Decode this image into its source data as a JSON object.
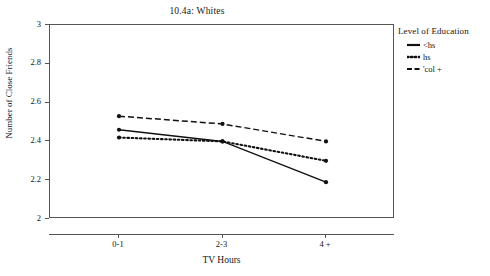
{
  "chart_data": {
    "type": "line",
    "title": "10.4a: Whites",
    "xlabel": "TV Hours",
    "ylabel": "Number of Close Friends",
    "categories": [
      "0-1",
      "2-3",
      "4 +"
    ],
    "ylim": [
      2,
      3
    ],
    "yticks": [
      "2",
      "2.2",
      "2.4",
      "2.6",
      "2.8",
      "3"
    ],
    "grid": false,
    "legend_position": "right",
    "legend_title": "Level of Education",
    "series": [
      {
        "name": "<hs",
        "style": "solid",
        "marker": "filled-circle",
        "values": [
          2.46,
          2.4,
          2.19
        ]
      },
      {
        "name": "hs",
        "style": "dotted",
        "marker": "filled-circle",
        "values": [
          2.42,
          2.4,
          2.3
        ]
      },
      {
        "name": "'col +",
        "style": "dash-dot",
        "marker": "filled-circle",
        "values": [
          2.53,
          2.49,
          2.4
        ]
      }
    ]
  },
  "legend": {
    "title": "Level of Education",
    "items": [
      {
        "label": "<hs"
      },
      {
        "label": "hs"
      },
      {
        "label": "'col +"
      }
    ]
  },
  "axes": {
    "y_title": "Number of Close Friends",
    "x_title": "TV Hours",
    "y_ticks": [
      "3",
      "2.8",
      "2.6",
      "2.4",
      "2.2",
      "2"
    ],
    "x_ticks": [
      "0-1",
      "2-3",
      "4 +"
    ]
  },
  "header": {
    "title": "10.4a: Whites"
  }
}
